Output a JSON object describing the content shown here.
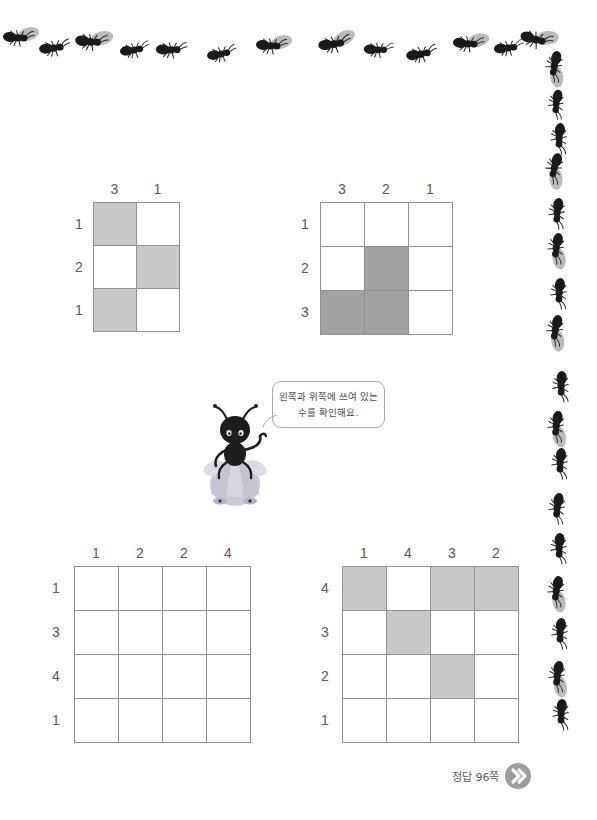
{
  "page": {
    "background_color": "#ffffff",
    "width": 597,
    "height": 820
  },
  "colors": {
    "line": "#8e9092",
    "text": "#58585a",
    "shade_light": "#c9c9c9",
    "shade_dark": "#a2a2a2",
    "ant_body": "#1a1a1a",
    "leaf": "#b9b9b9",
    "footer_circle": "#9d9d9f",
    "mascot_dress": "#c6c3d2"
  },
  "puzzles": [
    {
      "id": "puzzle-1",
      "col_labels": [
        "3",
        "1"
      ],
      "row_labels": [
        "1",
        "2",
        "1"
      ],
      "cells": [
        [
          "shaded",
          "empty"
        ],
        [
          "empty",
          "shaded"
        ],
        [
          "shaded",
          "empty"
        ]
      ],
      "shade_tone": "light"
    },
    {
      "id": "puzzle-2",
      "col_labels": [
        "3",
        "2",
        "1"
      ],
      "row_labels": [
        "1",
        "2",
        "3"
      ],
      "cells": [
        [
          "empty",
          "empty",
          "empty"
        ],
        [
          "empty",
          "shaded",
          "empty"
        ],
        [
          "shaded",
          "shaded",
          "empty"
        ]
      ],
      "shade_tone": "dark"
    },
    {
      "id": "puzzle-3",
      "col_labels": [
        "1",
        "2",
        "2",
        "4"
      ],
      "row_labels": [
        "1",
        "3",
        "4",
        "1"
      ],
      "cells": [
        [
          "empty",
          "empty",
          "empty",
          "empty"
        ],
        [
          "empty",
          "empty",
          "empty",
          "empty"
        ],
        [
          "empty",
          "empty",
          "empty",
          "empty"
        ],
        [
          "empty",
          "empty",
          "empty",
          "empty"
        ]
      ],
      "shade_tone": "light"
    },
    {
      "id": "puzzle-4",
      "col_labels": [
        "1",
        "4",
        "3",
        "2"
      ],
      "row_labels": [
        "4",
        "3",
        "2",
        "1"
      ],
      "cells": [
        [
          "shaded",
          "empty",
          "shaded",
          "shaded"
        ],
        [
          "empty",
          "shaded",
          "empty",
          "empty"
        ],
        [
          "empty",
          "empty",
          "shaded",
          "empty"
        ],
        [
          "empty",
          "empty",
          "empty",
          "empty"
        ]
      ],
      "shade_tone": "light"
    }
  ],
  "speech_bubble": {
    "line1": "왼쪽과 위쪽에 쓰여 있는",
    "line2": "수를 확인해요."
  },
  "mascot": {
    "name": "ant-character"
  },
  "footer": {
    "answer_text": "정답 96쪽",
    "icon": "double-chevron-right-icon"
  },
  "decorations": {
    "top_ants": [
      {
        "x": 2,
        "y": 28,
        "rot": 6,
        "flip": false,
        "leaf": true,
        "scale": 1.0
      },
      {
        "x": 38,
        "y": 38,
        "rot": -4,
        "flip": false,
        "leaf": false,
        "scale": 1.0
      },
      {
        "x": 75,
        "y": 32,
        "rot": 8,
        "flip": false,
        "leaf": true,
        "scale": 1.05
      },
      {
        "x": 118,
        "y": 40,
        "rot": -6,
        "flip": false,
        "leaf": false,
        "scale": 0.95
      },
      {
        "x": 155,
        "y": 40,
        "rot": 3,
        "flip": false,
        "leaf": false,
        "scale": 1.0
      },
      {
        "x": 205,
        "y": 44,
        "rot": -8,
        "flip": false,
        "leaf": false,
        "scale": 0.95
      },
      {
        "x": 255,
        "y": 36,
        "rot": 6,
        "flip": false,
        "leaf": true,
        "scale": 1.0
      },
      {
        "x": 318,
        "y": 34,
        "rot": -5,
        "flip": false,
        "leaf": true,
        "scale": 1.05
      },
      {
        "x": 362,
        "y": 40,
        "rot": 4,
        "flip": false,
        "leaf": false,
        "scale": 0.95
      },
      {
        "x": 405,
        "y": 44,
        "rot": -7,
        "flip": false,
        "leaf": false,
        "scale": 1.0
      },
      {
        "x": 452,
        "y": 34,
        "rot": 7,
        "flip": false,
        "leaf": true,
        "scale": 1.0
      },
      {
        "x": 492,
        "y": 38,
        "rot": -4,
        "flip": false,
        "leaf": false,
        "scale": 0.95
      },
      {
        "x": 520,
        "y": 30,
        "rot": 18,
        "flip": false,
        "leaf": true,
        "scale": 1.05
      }
    ],
    "right_ants": [
      {
        "x": 538,
        "y": 58,
        "rot": 104,
        "leaf": true,
        "scale": 1.0
      },
      {
        "x": 540,
        "y": 96,
        "rot": 100,
        "leaf": false,
        "scale": 0.95
      },
      {
        "x": 543,
        "y": 130,
        "rot": 96,
        "leaf": false,
        "scale": 1.0
      },
      {
        "x": 538,
        "y": 160,
        "rot": 108,
        "leaf": true,
        "scale": 1.0
      },
      {
        "x": 541,
        "y": 205,
        "rot": 98,
        "leaf": false,
        "scale": 1.0
      },
      {
        "x": 540,
        "y": 240,
        "rot": 102,
        "leaf": true,
        "scale": 1.0
      },
      {
        "x": 543,
        "y": 285,
        "rot": 96,
        "leaf": false,
        "scale": 1.0
      },
      {
        "x": 539,
        "y": 322,
        "rot": 104,
        "leaf": true,
        "scale": 1.0
      },
      {
        "x": 545,
        "y": 378,
        "rot": 94,
        "leaf": false,
        "scale": 1.0
      },
      {
        "x": 540,
        "y": 418,
        "rot": 100,
        "leaf": true,
        "scale": 1.0
      },
      {
        "x": 544,
        "y": 455,
        "rot": 96,
        "leaf": false,
        "scale": 1.0
      },
      {
        "x": 541,
        "y": 500,
        "rot": 100,
        "leaf": false,
        "scale": 1.0
      },
      {
        "x": 543,
        "y": 540,
        "rot": 94,
        "leaf": false,
        "scale": 1.0
      },
      {
        "x": 540,
        "y": 583,
        "rot": 102,
        "leaf": true,
        "scale": 1.0
      },
      {
        "x": 544,
        "y": 625,
        "rot": 96,
        "leaf": false,
        "scale": 1.0
      },
      {
        "x": 541,
        "y": 668,
        "rot": 100,
        "leaf": true,
        "scale": 1.0
      },
      {
        "x": 545,
        "y": 706,
        "rot": 95,
        "leaf": false,
        "scale": 1.0
      }
    ]
  }
}
